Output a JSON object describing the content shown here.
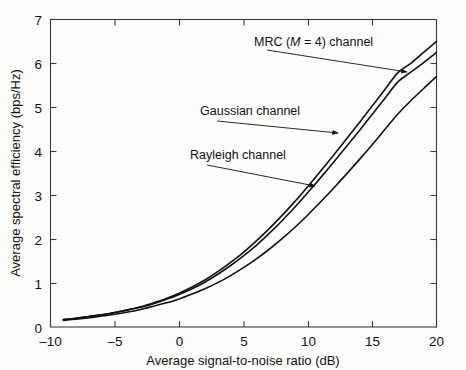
{
  "chart_data": {
    "type": "line",
    "title": "",
    "xlabel": "Average signal-to-noise ratio (dB)",
    "ylabel": "Average spectral efficiency (bps/Hz)",
    "xlim": [
      -10,
      20
    ],
    "ylim": [
      0,
      7
    ],
    "xticks": [
      -10,
      -5,
      0,
      5,
      10,
      15,
      20
    ],
    "xtick_labels": [
      "–10",
      "–5",
      "0",
      "5",
      "10",
      "15",
      "20"
    ],
    "yticks": [
      0,
      1,
      2,
      3,
      4,
      5,
      6,
      7
    ],
    "ytick_labels": [
      "0",
      "1",
      "2",
      "3",
      "4",
      "5",
      "6",
      "7"
    ],
    "grid": false,
    "legend_position": "inline-annotations",
    "x": [
      -9,
      -8,
      -7,
      -6,
      -5,
      -4,
      -3,
      -2,
      -1,
      0,
      1,
      2,
      3,
      4,
      5,
      6,
      7,
      8,
      9,
      10,
      11,
      12,
      13,
      14,
      15,
      16,
      17,
      18,
      19,
      20
    ],
    "series": [
      {
        "name": "MRC (M = 4) channel",
        "label_text": "MRC (",
        "label_italic": "M",
        "label_text_end": " = 4) channel",
        "color": "#111111",
        "values": [
          0.17,
          0.2,
          0.24,
          0.28,
          0.33,
          0.39,
          0.46,
          0.55,
          0.65,
          0.77,
          0.91,
          1.07,
          1.26,
          1.47,
          1.7,
          1.96,
          2.24,
          2.54,
          2.86,
          3.2,
          3.55,
          3.91,
          4.28,
          4.65,
          5.03,
          5.41,
          5.79,
          6.0,
          6.25,
          6.5
        ]
      },
      {
        "name": "Gaussian channel",
        "color": "#111111",
        "values": [
          0.17,
          0.2,
          0.24,
          0.28,
          0.33,
          0.39,
          0.45,
          0.53,
          0.63,
          0.74,
          0.87,
          1.02,
          1.2,
          1.4,
          1.62,
          1.86,
          2.13,
          2.42,
          2.73,
          3.06,
          3.4,
          3.75,
          4.11,
          4.47,
          4.84,
          5.21,
          5.58,
          5.8,
          6.02,
          6.25
        ]
      },
      {
        "name": "Rayleigh channel",
        "color": "#111111",
        "values": [
          0.15,
          0.18,
          0.21,
          0.25,
          0.29,
          0.34,
          0.4,
          0.47,
          0.55,
          0.64,
          0.75,
          0.87,
          1.01,
          1.17,
          1.35,
          1.55,
          1.77,
          2.01,
          2.27,
          2.55,
          2.85,
          3.16,
          3.48,
          3.81,
          4.15,
          4.5,
          4.85,
          5.15,
          5.43,
          5.7
        ]
      }
    ],
    "annotations": [
      {
        "name": "mrc-label",
        "text": "MRC (M = 4) channel",
        "x": 306,
        "y": 42
      },
      {
        "name": "gaussian-label",
        "text": "Gaussian channel",
        "x": 231,
        "y": 113
      },
      {
        "name": "rayleigh-label",
        "text": "Rayleigh channel",
        "x": 224,
        "y": 158
      }
    ]
  },
  "axis": {
    "x_title": "Average signal-to-noise ratio (dB)",
    "y_title": "Average spectral efficiency  (bps/Hz)"
  },
  "labels": {
    "mrc_prefix": "MRC (",
    "mrc_italic": "M",
    "mrc_suffix": " = 4) channel",
    "gaussian": "Gaussian channel",
    "rayleigh": "Rayleigh channel"
  }
}
